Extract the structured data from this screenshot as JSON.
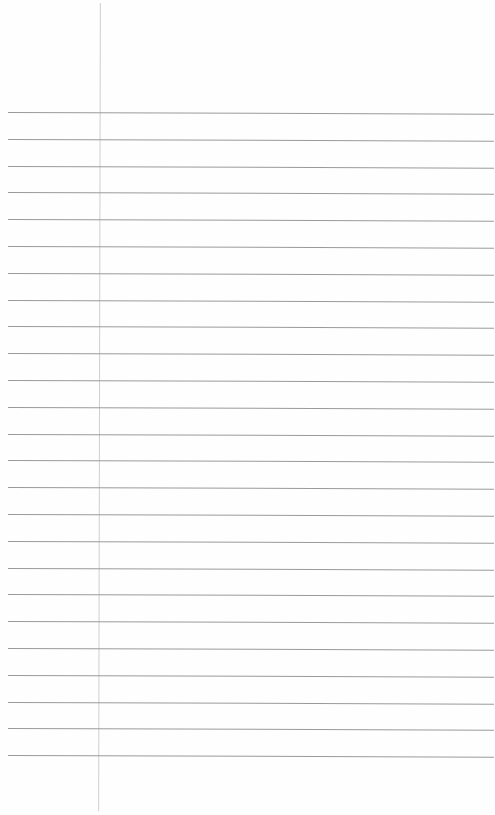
{
  "page": {
    "type": "ruled-paper",
    "background_color": "#fefefe",
    "rule_color": "#9a9a9a",
    "margin_color": "#cfcfcf",
    "rule_count": 25,
    "first_rule_y": 112,
    "rule_spacing": 26.8,
    "margin_x": 99,
    "text_content": ""
  }
}
